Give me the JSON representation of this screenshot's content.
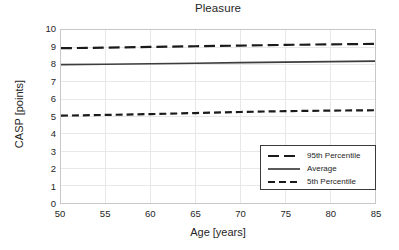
{
  "chart_data": {
    "type": "line",
    "title": "Pleasure",
    "xlabel": "Age [years]",
    "ylabel": "CASP [points]",
    "xlim": [
      50,
      85
    ],
    "ylim": [
      0,
      10
    ],
    "xticks": [
      50,
      55,
      60,
      65,
      70,
      75,
      80,
      85
    ],
    "yticks": [
      0,
      1,
      2,
      3,
      4,
      5,
      6,
      7,
      8,
      9,
      10
    ],
    "grid": true,
    "legend_position": "lower right",
    "x": [
      50,
      55,
      60,
      65,
      70,
      75,
      80,
      85
    ],
    "series": [
      {
        "name": "95th Percentile",
        "style": "dashed-long",
        "color": "#1a1a1a",
        "values": [
          8.95,
          8.98,
          9.02,
          9.06,
          9.1,
          9.14,
          9.17,
          9.2
        ]
      },
      {
        "name": "Average",
        "style": "solid",
        "color": "#3d3d3d",
        "values": [
          8.0,
          8.02,
          8.05,
          8.08,
          8.11,
          8.14,
          8.17,
          8.2
        ]
      },
      {
        "name": "5th Percentile",
        "style": "dashed-short",
        "color": "#1a1a1a",
        "values": [
          5.05,
          5.09,
          5.14,
          5.2,
          5.26,
          5.31,
          5.34,
          5.36
        ]
      }
    ]
  },
  "legend": {
    "items": [
      {
        "label": "95th Percentile"
      },
      {
        "label": "Average"
      },
      {
        "label": "5th Percentile"
      }
    ]
  },
  "colors": {
    "axis_line": "#c8c8c8",
    "grid_line": "#e8e8e8",
    "text": "#262626",
    "series_dark": "#1a1a1a",
    "series_average": "#3d3d3d",
    "legend_border": "#3a3a3a",
    "background": "#ffffff"
  }
}
